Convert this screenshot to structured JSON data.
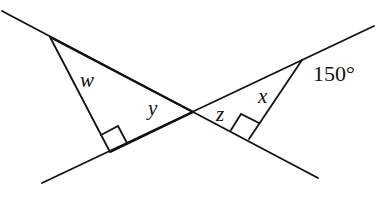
{
  "diagram": {
    "type": "geometry",
    "stroke_color": "#111111",
    "background": "#ffffff",
    "labels": {
      "w": "w",
      "y": "y",
      "z": "z",
      "x": "x",
      "angle": "150°"
    },
    "right_angle_markers": 2
  }
}
